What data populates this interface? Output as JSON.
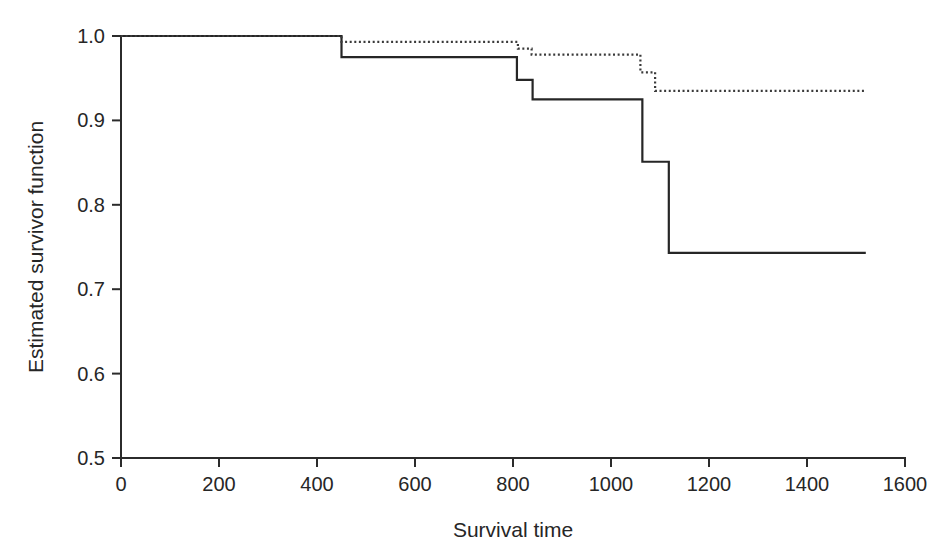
{
  "chart_data": {
    "type": "line",
    "title": "",
    "subtitle": "",
    "xlabel": "Survival time",
    "ylabel": "Estimated survivor function",
    "xlim": [
      0,
      1600
    ],
    "ylim": [
      0.5,
      1.0
    ],
    "xticks": [
      0,
      200,
      400,
      600,
      800,
      1000,
      1200,
      1400,
      1600
    ],
    "xticklabels": [
      "0",
      "200",
      "400",
      "600",
      "800",
      "1000",
      "1200",
      "1400",
      "1600"
    ],
    "yticks": [
      0.5,
      0.6,
      0.7,
      0.8,
      0.9,
      1.0
    ],
    "yticklabels": [
      "0.5",
      "0.6",
      "0.7",
      "0.8",
      "0.9",
      "1.0"
    ],
    "grid": false,
    "legend": "none",
    "step_mode": "post",
    "series": [
      {
        "name": "solid-group",
        "style": "solid",
        "color": "#262626",
        "x": [
          0,
          450,
          450,
          808,
          808,
          840,
          840,
          1064,
          1064,
          1118,
          1118,
          1520
        ],
        "y": [
          1.0,
          1.0,
          0.975,
          0.975,
          0.948,
          0.948,
          0.925,
          0.925,
          0.851,
          0.851,
          0.743,
          0.743
        ],
        "steps": [
          {
            "time": 0,
            "survival": 1.0
          },
          {
            "time": 450,
            "survival": 0.975
          },
          {
            "time": 808,
            "survival": 0.948
          },
          {
            "time": 840,
            "survival": 0.925
          },
          {
            "time": 1064,
            "survival": 0.851
          },
          {
            "time": 1118,
            "survival": 0.743
          },
          {
            "time": 1520,
            "survival": 0.743
          }
        ]
      },
      {
        "name": "dotted-group",
        "style": "dotted",
        "color": "#3a3a3a",
        "x": [
          0,
          450,
          450,
          810,
          810,
          838,
          838,
          1060,
          1060,
          1090,
          1090,
          1520
        ],
        "y": [
          1.0,
          1.0,
          0.993,
          0.993,
          0.985,
          0.985,
          0.978,
          0.978,
          0.957,
          0.957,
          0.935,
          0.935
        ],
        "steps": [
          {
            "time": 0,
            "survival": 1.0
          },
          {
            "time": 450,
            "survival": 0.993
          },
          {
            "time": 810,
            "survival": 0.985
          },
          {
            "time": 838,
            "survival": 0.978
          },
          {
            "time": 1060,
            "survival": 0.957
          },
          {
            "time": 1090,
            "survival": 0.935
          },
          {
            "time": 1520,
            "survival": 0.935
          }
        ]
      }
    ]
  }
}
